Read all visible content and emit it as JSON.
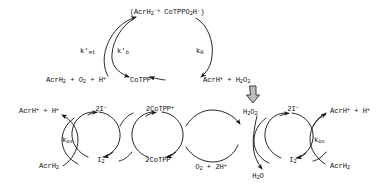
{
  "diagram": {
    "type": "reaction-scheme",
    "ink_color": "#111111"
  },
  "top_cycle": {
    "intermediate": "(AcrH2† CoTPPO2H†)",
    "intermediate_parts": {
      "open": "(AcrH",
      "sub1": "2",
      "dot1": "·+",
      "mid": " CoTPPO",
      "sub2": "2",
      "h": "H",
      "dot2": "·",
      "close": ")"
    },
    "reactants": "AcrH2 + O2 + H+",
    "product_left": "CoTPP+",
    "product_right": "AcrH+ + H2O2",
    "rate_et": "k'et",
    "rate_b": "k'b",
    "rate_h": "kH"
  },
  "left_cycle": {
    "top_left_label": "AcrH+ + H+",
    "bottom_left_label": "AcrH2",
    "rate_ox": "kox",
    "top_mid_label": "2I−",
    "bottom_mid_label": "I2",
    "top_right_label": "2CoTPP+",
    "bottom_right_label": "2CoTPP"
  },
  "center_cycle": {
    "top_label": "H2O2",
    "bottom_label": "O2 + 2H+"
  },
  "right_cycle": {
    "top_left_label": "H2O2",
    "bottom_left_label": "H2O",
    "top_mid_label": "2I−",
    "bottom_mid_label": "I2",
    "rate_ox": "kox",
    "top_right_label": "AcrH+ + H+",
    "bottom_right_label": "AcrH2"
  },
  "connector": {
    "name": "thick-down-arrow",
    "direction": "down"
  }
}
